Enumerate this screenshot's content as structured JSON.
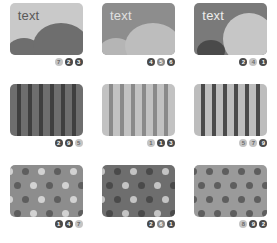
{
  "palette": {
    "page_background": "#ffffff",
    "light": "#c9c9c9",
    "light2": "#bfbfbf",
    "mid_light": "#a8a8a8",
    "mid": "#8d8d8d",
    "mid_dark": "#7a7a7a",
    "dark": "#636363",
    "darker": "#545454",
    "darkest": "#3f3f3f",
    "text_dark": "#5a5a5a",
    "text_light": "#e0e0e0",
    "badge_dark": "#4a4a4a",
    "badge_light": "#c4c4c4",
    "badge_mid": "#8a8a8a",
    "badge_text_light": "#ffffff",
    "badge_text_dark": "#6b6b6b"
  },
  "cells": [
    {
      "name": "scene-light",
      "kind": "scene",
      "label": "text",
      "label_color": "#5a5a5a",
      "background": "#c9c9c9",
      "hill_big_color": "#6e6e6e",
      "hill_small_color": "#6e6e6e",
      "badges": [
        {
          "value": "7",
          "fill": "#c4c4c4",
          "color": "#6b6b6b"
        },
        {
          "value": "2",
          "fill": "#4a4a4a",
          "color": "#ffffff"
        },
        {
          "value": "3",
          "fill": "#4a4a4a",
          "color": "#ffffff"
        }
      ]
    },
    {
      "name": "scene-mid",
      "kind": "scene",
      "label": "text",
      "label_color": "#e0e0e0",
      "background": "#8d8d8d",
      "hill_big_color": "#bdbdbd",
      "hill_small_color": "#b5b5b5",
      "badges": [
        {
          "value": "4",
          "fill": "#4a4a4a",
          "color": "#ffffff"
        },
        {
          "value": "5",
          "fill": "#8a8a8a",
          "color": "#ffffff"
        },
        {
          "value": "6",
          "fill": "#4a4a4a",
          "color": "#ffffff"
        }
      ]
    },
    {
      "name": "scene-dark",
      "kind": "scene",
      "label": "text",
      "label_color": "#ededed",
      "background": "#7a7a7a",
      "hill_big_color": "#c6c6c6",
      "hill_small_color": "#4a4a4a",
      "badges": [
        {
          "value": "2",
          "fill": "#4a4a4a",
          "color": "#ffffff"
        },
        {
          "value": "4",
          "fill": "#c4c4c4",
          "color": "#6b6b6b"
        },
        {
          "value": "1",
          "fill": "#4a4a4a",
          "color": "#ffffff"
        }
      ]
    },
    {
      "name": "stripes-dark",
      "kind": "stripes",
      "background": "#6e6e6e",
      "stripe_color": "#3f3f3f",
      "stripe_width": 4,
      "stripe_gap": 7,
      "badges": [
        {
          "value": "2",
          "fill": "#4a4a4a",
          "color": "#ffffff"
        },
        {
          "value": "9",
          "fill": "#4a4a4a",
          "color": "#ffffff"
        },
        {
          "value": "5",
          "fill": "#c4c4c4",
          "color": "#6b6b6b"
        }
      ]
    },
    {
      "name": "stripes-light",
      "kind": "stripes",
      "background": "#c2c2c2",
      "stripe_color": "#8a8a8a",
      "stripe_width": 4,
      "stripe_gap": 7,
      "badges": [
        {
          "value": "1",
          "fill": "#c4c4c4",
          "color": "#6b6b6b"
        },
        {
          "value": "1",
          "fill": "#4a4a4a",
          "color": "#ffffff"
        },
        {
          "value": "3",
          "fill": "#4a4a4a",
          "color": "#ffffff"
        }
      ]
    },
    {
      "name": "stripes-contrast",
      "kind": "stripes",
      "background": "#bdbdbd",
      "stripe_color": "#4a4a4a",
      "stripe_width": 4,
      "stripe_gap": 7,
      "badges": [
        {
          "value": "5",
          "fill": "#c4c4c4",
          "color": "#6b6b6b"
        },
        {
          "value": "7",
          "fill": "#c4c4c4",
          "color": "#6b6b6b"
        },
        {
          "value": "9",
          "fill": "#4a4a4a",
          "color": "#ffffff"
        }
      ]
    },
    {
      "name": "dots-mid",
      "kind": "dots",
      "background": "#8d8d8d",
      "dot_light": "#d2d2d2",
      "dot_dark": "#5e5e5e",
      "alternate": true,
      "badges": [
        {
          "value": "1",
          "fill": "#4a4a4a",
          "color": "#ffffff"
        },
        {
          "value": "4",
          "fill": "#4a4a4a",
          "color": "#ffffff"
        },
        {
          "value": "7",
          "fill": "#c4c4c4",
          "color": "#6b6b6b"
        }
      ]
    },
    {
      "name": "dots-dark",
      "kind": "dots",
      "background": "#6e6e6e",
      "dot_light": "#c4c4c4",
      "dot_dark": "#4a4a4a",
      "alternate": true,
      "badges": [
        {
          "value": "2",
          "fill": "#4a4a4a",
          "color": "#ffffff"
        },
        {
          "value": "6",
          "fill": "#8a8a8a",
          "color": "#ffffff"
        },
        {
          "value": "1",
          "fill": "#4a4a4a",
          "color": "#ffffff"
        }
      ]
    },
    {
      "name": "dots-light",
      "kind": "dots",
      "background": "#9a9a9a",
      "dot_light": "#5e5e5e",
      "dot_dark": "#5e5e5e",
      "alternate": false,
      "badges": [
        {
          "value": "8",
          "fill": "#c4c4c4",
          "color": "#6b6b6b"
        },
        {
          "value": "9",
          "fill": "#4a4a4a",
          "color": "#ffffff"
        },
        {
          "value": "2",
          "fill": "#4a4a4a",
          "color": "#ffffff"
        }
      ]
    }
  ]
}
